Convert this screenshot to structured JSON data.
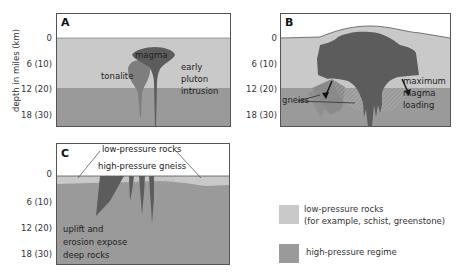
{
  "y_axis": {
    "label": "depth in miles (km)",
    "ticks": [
      "0",
      "6 (10)",
      "12 (20)",
      "18 (30)"
    ]
  },
  "panels": {
    "A": {
      "letter": "A",
      "labels": {
        "magma": "magma",
        "tonalite": "tonalite",
        "caption_lines": [
          "early",
          "pluton",
          "intrusion"
        ]
      }
    },
    "B": {
      "letter": "B",
      "labels": {
        "gneiss": "gneiss",
        "caption_lines": [
          "maximum",
          "magma",
          "loading"
        ]
      }
    },
    "C": {
      "letter": "C",
      "labels": {
        "low_pressure": "low-pressure rocks",
        "high_pressure": "high-pressure gneiss",
        "caption_lines": [
          "uplift and",
          "erosion expose",
          "deep rocks"
        ]
      }
    }
  },
  "legend": {
    "items": [
      {
        "label_lines": [
          "low-pressure rocks",
          "(for example, schist, greenstone)"
        ],
        "color": "#c9c9c9"
      },
      {
        "label_lines": [
          "high-pressure regime"
        ],
        "color": "#9a9a9a"
      }
    ]
  },
  "colors": {
    "low_pressure": "#c9c9c9",
    "high_pressure": "#9a9a9a",
    "magma": "#5c5c5c",
    "tonalite": "#7e7e7e",
    "border": "#555555"
  }
}
